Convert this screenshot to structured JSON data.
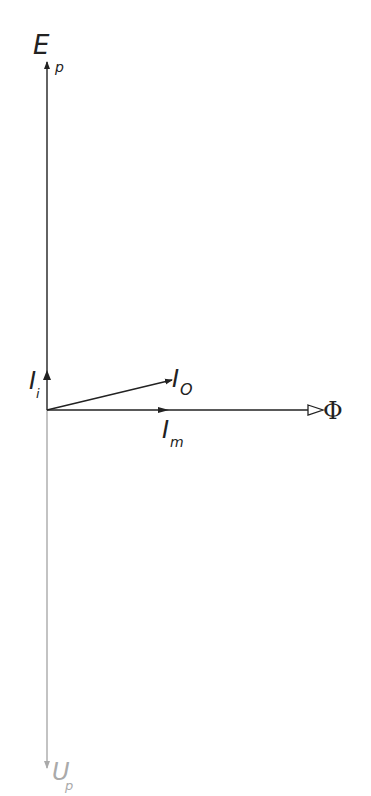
{
  "diagram": {
    "title": "",
    "type": "phasor diagram (transformer no-load)",
    "colors": {
      "main": "#222222",
      "faded": "#aaaaaa",
      "background": "#ffffff"
    },
    "origin": [
      47,
      410
    ],
    "vectors": [
      {
        "id": "Ep",
        "label": "E",
        "subscript": "p",
        "from": [
          47,
          410
        ],
        "to": [
          47,
          62
        ],
        "color": "#222222"
      },
      {
        "id": "Up",
        "label": "U",
        "subscript": "p",
        "from": [
          47,
          410
        ],
        "to": [
          47,
          768
        ],
        "color": "#aaaaaa"
      },
      {
        "id": "Ii",
        "label": "I",
        "subscript": "i",
        "from": [
          47,
          410
        ],
        "to": [
          47,
          370
        ],
        "color": "#222222"
      },
      {
        "id": "Io",
        "label": "I",
        "subscript": "O",
        "from": [
          47,
          410
        ],
        "to": [
          172,
          380
        ],
        "color": "#222222"
      },
      {
        "id": "Im",
        "label": "I",
        "subscript": "m",
        "from": [
          47,
          410
        ],
        "to": [
          168,
          410
        ],
        "color": "#222222"
      },
      {
        "id": "Phi",
        "label": "Φ",
        "subscript": "",
        "from": [
          47,
          410
        ],
        "to": [
          323,
          410
        ],
        "color": "#222222"
      }
    ]
  },
  "labels": {
    "Ep_main": "E",
    "Ep_sub": "p",
    "Up_main": "U",
    "Up_sub": "p",
    "Ii_main": "I",
    "Ii_sub": "i",
    "Io_main": "I",
    "Io_sub": "O",
    "Im_main": "I",
    "Im_sub": "m",
    "Phi": "Φ"
  }
}
